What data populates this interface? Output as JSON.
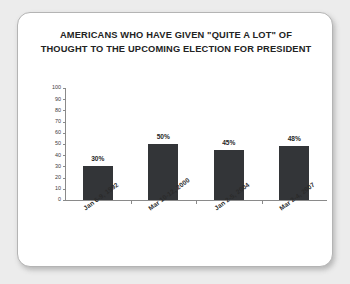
{
  "chart_data": {
    "type": "bar",
    "title": "AMERICANS WHO HAVE GIVEN \"QUITE A LOT\" OF THOUGHT TO THE UPCOMING ELECTION FOR PRESIDENT",
    "title_line1": "AMERICANS WHO HAVE GIVEN \"QUITE A LOT\" OF",
    "title_line2": "THOUGHT TO THE UPCOMING ELECTION FOR PRESIDENT",
    "categories": [
      "Jan 6-9, 1992",
      "Mar 10-12, 2000",
      "Jan 2-5, 2004",
      "Mar 2-4, 2007"
    ],
    "values": [
      30,
      50,
      45,
      48
    ],
    "data_labels": [
      "30%",
      "50%",
      "45%",
      "48%"
    ],
    "xlabel": "",
    "ylabel": "",
    "ylim": [
      0,
      100
    ],
    "yticks": [
      100,
      90,
      80,
      70,
      60,
      50,
      40,
      30,
      20,
      10,
      0
    ],
    "ytick_labels": [
      "100",
      "90",
      "80",
      "70",
      "60",
      "50",
      "40",
      "30",
      "20",
      "10",
      "0"
    ],
    "grid": false,
    "legend": false,
    "bar_color": "#333538",
    "axis_color": "#8a8a8a",
    "card_background": "#ffffff",
    "page_background": "#ececec"
  }
}
